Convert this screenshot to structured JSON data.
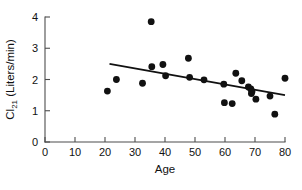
{
  "chart_data": {
    "type": "scatter",
    "title": "",
    "subtitle": "",
    "xlabel": "Age",
    "ylabel": "Cl",
    "ylabel_subscript": "21",
    "ylabel_units": " (Liters/min)",
    "ylabel_full": "Cl21 (Liters/min)",
    "xlim": [
      0,
      80
    ],
    "ylim": [
      0,
      4
    ],
    "xticks": [
      0,
      10,
      20,
      30,
      40,
      50,
      60,
      70,
      80
    ],
    "yticks": [
      0,
      1,
      2,
      3,
      4
    ],
    "xticklabels": [
      "0",
      "10",
      "20",
      "30",
      "40",
      "50",
      "60",
      "70",
      "80"
    ],
    "yticklabels": [
      "0",
      "1",
      "2",
      "3",
      "4"
    ],
    "grid": false,
    "legend": null,
    "marker": "filled-circle",
    "marker_color": "#111111",
    "axis_color": "#4d4d4d",
    "points": [
      {
        "x": 20.8,
        "y": 1.63
      },
      {
        "x": 23.8,
        "y": 2.0
      },
      {
        "x": 32.5,
        "y": 1.88
      },
      {
        "x": 35.4,
        "y": 3.85
      },
      {
        "x": 35.6,
        "y": 2.41
      },
      {
        "x": 39.3,
        "y": 2.48
      },
      {
        "x": 40.2,
        "y": 2.12
      },
      {
        "x": 47.8,
        "y": 2.68
      },
      {
        "x": 48.2,
        "y": 2.07
      },
      {
        "x": 53.0,
        "y": 1.99
      },
      {
        "x": 59.6,
        "y": 1.85
      },
      {
        "x": 59.8,
        "y": 1.26
      },
      {
        "x": 62.4,
        "y": 1.23
      },
      {
        "x": 63.6,
        "y": 2.2
      },
      {
        "x": 65.6,
        "y": 1.96
      },
      {
        "x": 67.8,
        "y": 1.76
      },
      {
        "x": 68.6,
        "y": 1.7
      },
      {
        "x": 68.8,
        "y": 1.55
      },
      {
        "x": 69.0,
        "y": 1.62
      },
      {
        "x": 70.3,
        "y": 1.37
      },
      {
        "x": 75.0,
        "y": 1.47
      },
      {
        "x": 76.6,
        "y": 0.89
      },
      {
        "x": 80.0,
        "y": 2.04
      }
    ],
    "fit_line": {
      "type": "linear-regression",
      "x_start": 21.5,
      "y_start": 2.5,
      "x_end": 80.0,
      "y_end": 1.5
    }
  }
}
